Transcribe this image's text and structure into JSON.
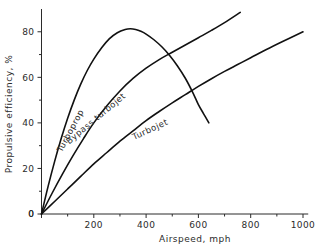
{
  "chart_data": {
    "type": "line",
    "title": "",
    "subtitle": "",
    "xlabel": "Airspeed, mph",
    "ylabel": "Propulsive efficiency, %",
    "xlim": [
      0,
      1040
    ],
    "ylim": [
      0,
      90
    ],
    "grid": false,
    "legend_position": "inline-curve-labels",
    "x_ticks_major": [
      0,
      200,
      400,
      600,
      800,
      1000
    ],
    "x_ticks_minor": [
      100,
      300,
      500,
      700,
      900
    ],
    "x_ticklabels": [
      "0",
      "200",
      "400",
      "600",
      "800",
      "1000"
    ],
    "y_ticks_major": [
      0,
      20,
      40,
      60,
      80
    ],
    "y_ticks_minor": [
      10,
      30,
      50,
      70
    ],
    "y_ticklabels": [
      "0",
      "20",
      "40",
      "60",
      "80"
    ],
    "annotations": [
      {
        "text": "Turboprop",
        "x": 120,
        "y": 36,
        "rotation": -62
      },
      {
        "text": "Bypass turbojet",
        "x": 215,
        "y": 41,
        "rotation": -40
      },
      {
        "text": "Turbojet",
        "x": 420,
        "y": 36,
        "rotation": -25
      }
    ],
    "series": [
      {
        "name": "Turboprop",
        "color": "#111111",
        "x": [
          0,
          25,
          50,
          75,
          100,
          125,
          150,
          175,
          200,
          230,
          260,
          290,
          320,
          340,
          360,
          380,
          400,
          430,
          460,
          490,
          520,
          550,
          580,
          600,
          620,
          640
        ],
        "y": [
          0,
          12,
          23,
          33,
          42,
          50,
          57,
          63,
          68,
          73,
          77,
          79.6,
          81,
          81.3,
          81,
          80.2,
          79,
          76.5,
          73.4,
          69.6,
          65,
          59.6,
          53,
          48,
          44,
          40
        ]
      },
      {
        "name": "Bypass turbojet",
        "color": "#111111",
        "x": [
          0,
          40,
          80,
          120,
          160,
          200,
          250,
          300,
          350,
          400,
          450,
          500,
          550,
          600,
          650,
          700,
          760
        ],
        "y": [
          0,
          9,
          17.5,
          25.5,
          33,
          40,
          47.5,
          54,
          59.5,
          64,
          67.8,
          71,
          74.2,
          77.4,
          80.6,
          84,
          88.5
        ]
      },
      {
        "name": "Turbojet",
        "color": "#111111",
        "x": [
          0,
          50,
          100,
          150,
          200,
          250,
          300,
          350,
          400,
          450,
          500,
          550,
          600,
          650,
          700,
          750,
          800,
          860,
          920,
          1000
        ],
        "y": [
          0,
          5.5,
          11,
          16.5,
          22,
          27,
          32,
          36.5,
          41,
          45,
          48.8,
          52.4,
          56,
          59.4,
          62.6,
          65.6,
          68.6,
          72.2,
          75.6,
          80
        ]
      }
    ]
  },
  "axes": {
    "x_title": "Airspeed, mph",
    "y_title": "Propulsive efficiency, %"
  },
  "tick_text": {
    "x": [
      "0",
      "200",
      "400",
      "600",
      "800",
      "1000"
    ],
    "y": [
      "0",
      "20",
      "40",
      "60",
      "80"
    ]
  },
  "curve_labels": {
    "turboprop": "Turboprop",
    "bypass_turbojet": "Bypass turbojet",
    "turbojet": "Turbojet"
  },
  "colors": {
    "curve": "#111111",
    "axis": "#2b2b2b",
    "background": "#ffffff"
  }
}
